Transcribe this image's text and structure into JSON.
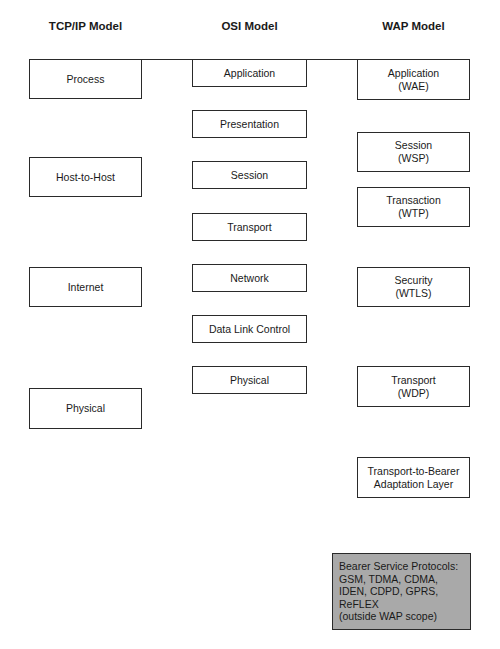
{
  "columns": {
    "tcpip": {
      "title": "TCP/IP Model",
      "layers": [
        "Process",
        "Host-to-Host",
        "Internet",
        "Physical"
      ]
    },
    "osi": {
      "title": "OSI Model",
      "layers": [
        "Application",
        "Presentation",
        "Session",
        "Transport",
        "Network",
        "Data Link Control",
        "Physical"
      ]
    },
    "wap": {
      "title": "WAP Model",
      "layers": [
        "Application\n(WAE)",
        "Session\n(WSP)",
        "Transaction\n(WTP)",
        "Security\n(WTLS)",
        "Transport\n(WDP)",
        "Transport-to-Bearer\nAdaptation Layer"
      ],
      "bearer": "Bearer Service Protocols:\nGSM, TDMA, CDMA,\nIDEN, CDPD, GPRS,\nReFLEX\n(outside WAP scope)"
    }
  },
  "colors": {
    "border": "#2a2a2a",
    "bearer_fill": "#a9a9a9",
    "background": "#ffffff"
  }
}
